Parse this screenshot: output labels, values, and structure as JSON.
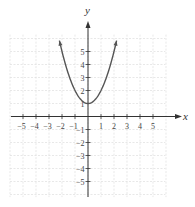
{
  "chart_data": {
    "type": "line",
    "title": "",
    "function": "y = x^2 + 1",
    "xlabel": "x",
    "ylabel": "y",
    "xlim": [
      -6,
      6
    ],
    "ylim": [
      -6,
      6
    ],
    "grid": true,
    "x_ticks": [
      -5,
      -4,
      -3,
      -2,
      -1,
      1,
      2,
      3,
      4,
      5
    ],
    "y_ticks": [
      -5,
      -4,
      -3,
      -2,
      -1,
      1,
      2,
      3,
      4,
      5
    ],
    "x_tick_labels": [
      "−5",
      "−4",
      "−3",
      "−2",
      "−1",
      "1",
      "2",
      "3",
      "4",
      "5"
    ],
    "y_tick_labels": [
      "−5",
      "−4",
      "−3",
      "−2",
      "−1",
      "1",
      "2",
      "3",
      "4",
      "5"
    ],
    "series": [
      {
        "name": "parabola",
        "x": [
          -2.2,
          -2,
          -1.5,
          -1,
          -0.5,
          0,
          0.5,
          1,
          1.5,
          2,
          2.2
        ],
        "y": [
          5.84,
          5,
          3.25,
          2,
          1.25,
          1,
          1.25,
          2,
          3.25,
          5,
          5.84
        ],
        "color": "#555555",
        "arrows_at_ends": true
      }
    ],
    "vertex": [
      0,
      1
    ]
  },
  "colors": {
    "curve": "#555555",
    "axis": "#333333",
    "grid": "#d8d8d8"
  }
}
